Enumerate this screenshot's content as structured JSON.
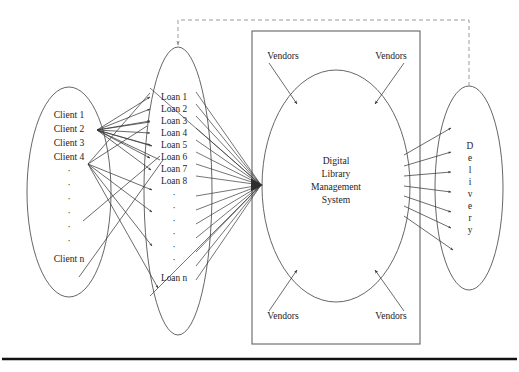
{
  "figure": {
    "type": "diagram",
    "title_text": "",
    "groups": {
      "clients": {
        "name": "Client group",
        "items": [
          "Client 1",
          "Client 2",
          "Client 3",
          "Client 4"
        ],
        "ellipsis": "·",
        "ellipsis_count": 6,
        "last_item": "Client n"
      },
      "loans": {
        "name": "Loan group",
        "items": [
          "Loan 1",
          "Loan 2",
          "Loan 3",
          "Loan 4",
          "Loan 5",
          "Loan 6",
          "Loan 7",
          "Loan 8"
        ],
        "ellipsis": "·",
        "ellipsis_count": 7,
        "last_item": "Loan n"
      },
      "core": {
        "name": "Digital Library Management System",
        "lines": [
          "Digital",
          "Library",
          "Management",
          "System"
        ]
      },
      "vendors": {
        "label": "Vendors",
        "positions": [
          "top-left",
          "top-right",
          "bottom-left",
          "bottom-right"
        ],
        "labels": [
          "Vendors",
          "Vendors",
          "Vendors",
          "Vendors"
        ]
      },
      "delivery": {
        "name": "Delivery",
        "letters": [
          "D",
          "e",
          "l",
          "i",
          "v",
          "e",
          "r",
          "y"
        ]
      }
    },
    "connections": {
      "clients_to_loans": "fan of arrows from client hub points to each loan",
      "loans_to_core": "converging arrows from loans to a single arrowhead at the core ellipse",
      "vendors_to_core": "four arrows from corner Vendors labels into the core ellipse",
      "core_to_delivery": "fan of seven arrows from core ellipse to Delivery ellipse",
      "feedback": "dashed feedback line from Delivery top across to Loan group top"
    },
    "colors": {
      "stroke": "#555555",
      "connector": "#3a3a3a",
      "dashed": "#9a9a9a",
      "text": "#1c1c1c",
      "rule": "#111111",
      "background": "#ffffff"
    }
  }
}
